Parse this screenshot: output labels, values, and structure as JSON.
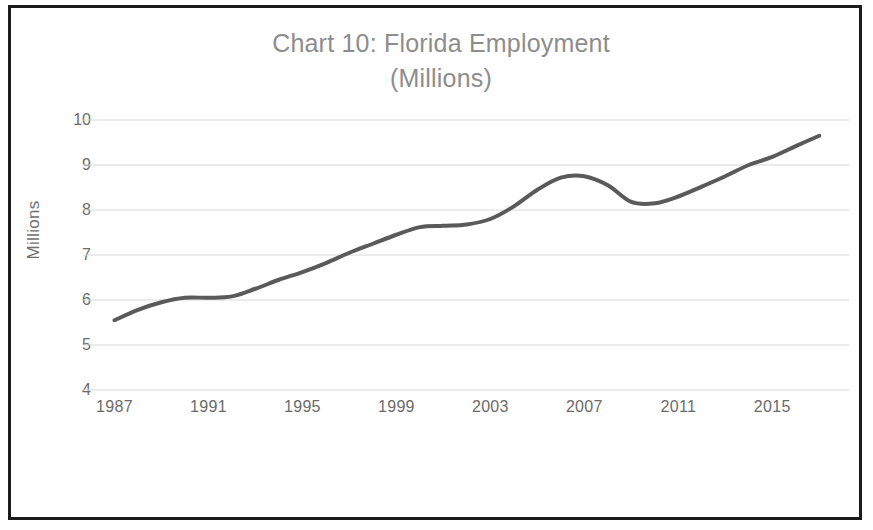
{
  "figure": {
    "title_line1": "Chart 10: Florida Employment",
    "title_line2": "(Millions)",
    "title_full": "Chart 10: Florida Employment (Millions)",
    "border_color": "#1b1b1b",
    "background_color": "#ffffff"
  },
  "axes": {
    "ylabel": "Millions",
    "ytick_labels": [
      "10",
      "9",
      "8",
      "7",
      "6",
      "5",
      "4"
    ],
    "xtick_labels": [
      "1987",
      "1991",
      "1995",
      "1999",
      "2003",
      "2007",
      "2011",
      "2015"
    ]
  },
  "chart_data": {
    "type": "line",
    "title": "Chart 10: Florida Employment (Millions)",
    "xlabel": "",
    "ylabel": "Millions",
    "xlim": [
      1986,
      2017.5
    ],
    "ylim": [
      4,
      10
    ],
    "yticks": [
      4,
      5,
      6,
      7,
      8,
      9,
      10
    ],
    "xticks": [
      1987,
      1991,
      1995,
      1999,
      2003,
      2007,
      2011,
      2015
    ],
    "grid": "horizontal",
    "legend": "none",
    "line_color": "#5a5a5a",
    "line_width": 4,
    "x": [
      1987,
      1988,
      1989,
      1990,
      1991,
      1992,
      1993,
      1994,
      1995,
      1996,
      1997,
      1998,
      1999,
      2000,
      2001,
      2002,
      2003,
      2004,
      2005,
      2006,
      2007,
      2008,
      2009,
      2010,
      2011,
      2012,
      2013,
      2014,
      2015,
      2016,
      2017
    ],
    "values": [
      5.55,
      5.78,
      5.95,
      6.05,
      6.05,
      6.08,
      6.25,
      6.45,
      6.62,
      6.82,
      7.05,
      7.25,
      7.45,
      7.62,
      7.65,
      7.68,
      7.8,
      8.08,
      8.45,
      8.72,
      8.75,
      8.55,
      8.18,
      8.15,
      8.3,
      8.52,
      8.75,
      9.0,
      9.18,
      9.42,
      9.65
    ],
    "series": [
      {
        "name": "Florida Employment",
        "values": [
          5.55,
          5.78,
          5.95,
          6.05,
          6.05,
          6.08,
          6.25,
          6.45,
          6.62,
          6.82,
          7.05,
          7.25,
          7.45,
          7.62,
          7.65,
          7.68,
          7.8,
          8.08,
          8.45,
          8.72,
          8.75,
          8.55,
          8.18,
          8.15,
          8.3,
          8.52,
          8.75,
          9.0,
          9.18,
          9.42,
          9.65
        ]
      }
    ]
  }
}
